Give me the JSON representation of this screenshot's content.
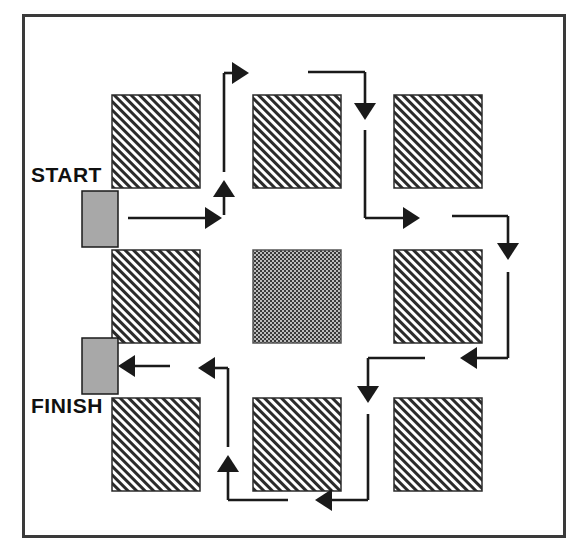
{
  "diagram": {
    "type": "flow-path-diagram",
    "labels": {
      "start": "START",
      "finish": "FINISH"
    },
    "colors": {
      "ink": "#1a1a1a",
      "frame": "#3a3a3a",
      "hatch_fill": "#ffffff",
      "hatch_stroke": "#2b2b2b",
      "gate_gray": "#a8a8a8",
      "center_dark": "#404040",
      "background": "#ffffff"
    },
    "frame": {
      "x": 22,
      "y": 14,
      "width": 541,
      "height": 521
    },
    "blocks": [
      {
        "name": "block-top-left",
        "row": 1,
        "col": 1,
        "x": 112,
        "y": 95,
        "w": 88,
        "h": 93,
        "fill": "hatch"
      },
      {
        "name": "block-top-center",
        "row": 1,
        "col": 2,
        "x": 253,
        "y": 95,
        "w": 88,
        "h": 93,
        "fill": "hatch"
      },
      {
        "name": "block-top-right",
        "row": 1,
        "col": 3,
        "x": 394,
        "y": 95,
        "w": 88,
        "h": 93,
        "fill": "hatch"
      },
      {
        "name": "block-middle-left",
        "row": 2,
        "col": 1,
        "x": 112,
        "y": 250,
        "w": 88,
        "h": 93,
        "fill": "hatch"
      },
      {
        "name": "block-center",
        "row": 2,
        "col": 2,
        "x": 253,
        "y": 250,
        "w": 88,
        "h": 93,
        "fill": "dots"
      },
      {
        "name": "block-middle-right",
        "row": 2,
        "col": 3,
        "x": 394,
        "y": 250,
        "w": 88,
        "h": 93,
        "fill": "hatch"
      },
      {
        "name": "block-bottom-left",
        "row": 3,
        "col": 1,
        "x": 112,
        "y": 398,
        "w": 88,
        "h": 93,
        "fill": "hatch"
      },
      {
        "name": "block-bottom-center",
        "row": 3,
        "col": 2,
        "x": 253,
        "y": 398,
        "w": 88,
        "h": 93,
        "fill": "hatch"
      },
      {
        "name": "block-bottom-right",
        "row": 3,
        "col": 3,
        "x": 394,
        "y": 398,
        "w": 88,
        "h": 93,
        "fill": "hatch"
      }
    ],
    "gates": [
      {
        "name": "start-gate",
        "x": 82,
        "y": 191,
        "w": 36,
        "h": 56
      },
      {
        "name": "finish-gate",
        "x": 82,
        "y": 338,
        "w": 36,
        "h": 56
      }
    ],
    "path_segments": [
      {
        "name": "segment-start-right",
        "d": "M 128 218 L 222 218",
        "arrow": "end-right"
      },
      {
        "name": "segment-corridor1-up",
        "d": "M 224 215 L 224 180",
        "arrow": "end-up"
      },
      {
        "name": "segment-corridor1-up-cont",
        "d": "M 224 172 L 224 73",
        "arrow": "none"
      },
      {
        "name": "segment-top-right1",
        "d": "M 224 73 L 249 73",
        "arrow": "end-right"
      },
      {
        "name": "segment-top-run",
        "d": "M 308 72 L 365 72",
        "arrow": "none"
      },
      {
        "name": "segment-corridor2-down",
        "d": "M 365 72 L 365 120",
        "arrow": "end-down"
      },
      {
        "name": "segment-corridor2-down-cont",
        "d": "M 365 130 L 365 218",
        "arrow": "none"
      },
      {
        "name": "segment-mid-right1",
        "d": "M 365 218 L 420 218",
        "arrow": "end-right"
      },
      {
        "name": "segment-mid-right2",
        "d": "M 452 216 L 508 216",
        "arrow": "none"
      },
      {
        "name": "segment-right-down",
        "d": "M 508 216 L 508 260",
        "arrow": "end-down"
      },
      {
        "name": "segment-right-down-cont",
        "d": "M 508 272 L 508 358",
        "arrow": "none"
      },
      {
        "name": "segment-mid-left1",
        "d": "M 508 358 L 460 358",
        "arrow": "end-left"
      },
      {
        "name": "segment-mid-left2",
        "d": "M 425 358 L 368 358",
        "arrow": "none"
      },
      {
        "name": "segment-corridor3-down",
        "d": "M 368 358 L 368 403",
        "arrow": "end-down"
      },
      {
        "name": "segment-corridor3-down-cont",
        "d": "M 368 414 L 368 500",
        "arrow": "none"
      },
      {
        "name": "segment-bottom-left1",
        "d": "M 368 500 L 315 500",
        "arrow": "end-left"
      },
      {
        "name": "segment-bottom-left2",
        "d": "M 288 500 L 228 500",
        "arrow": "none"
      },
      {
        "name": "segment-corridor4-up",
        "d": "M 228 500 L 228 455",
        "arrow": "end-up"
      },
      {
        "name": "segment-corridor4-up-cont",
        "d": "M 228 447 L 228 368",
        "arrow": "none"
      },
      {
        "name": "segment-finish-left1",
        "d": "M 228 368 L 198 368",
        "arrow": "end-left"
      },
      {
        "name": "segment-finish-left2",
        "d": "M 170 366 L 118 366",
        "arrow": "end-left"
      }
    ]
  }
}
